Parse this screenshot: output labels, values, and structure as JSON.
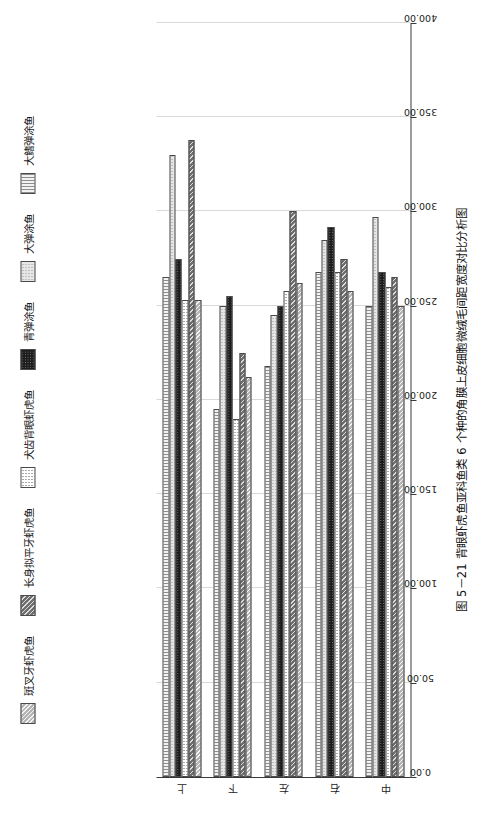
{
  "caption": "图 5－21  背眼虾虎鱼亚科鱼类 6 个种的角膜上皮细胞微绒毛间距宽度对比分析图",
  "legend": {
    "items": [
      {
        "label": "斑叉牙虾虎鱼",
        "pattern": "diagonal-light-hatch",
        "color": "#b4b4b4"
      },
      {
        "label": "长身拟平牙虾虎鱼",
        "pattern": "diagonal-dark-hatch",
        "color": "#6e6e6e"
      },
      {
        "label": "犬齿背眼虾虎鱼",
        "pattern": "sparse-dots",
        "color": "#ffffff"
      },
      {
        "label": "青弹涂鱼",
        "pattern": "solid-black-dots",
        "color": "#1c1c1c"
      },
      {
        "label": "大弹涂鱼",
        "pattern": "fine-dots-light",
        "color": "#e6e6e6"
      },
      {
        "label": "大鳍弹涂鱼",
        "pattern": "vertical-lines",
        "color": "#f2f2f2"
      }
    ]
  },
  "chart_data": {
    "type": "bar",
    "orientation": "horizontal",
    "title": "图 5－21  背眼虾虎鱼亚科鱼类 6 个种的角膜上皮细胞微绒毛间距宽度对比分析图",
    "xlabel": "",
    "ylabel": "",
    "categories": [
      "上",
      "下",
      "左",
      "右",
      "中"
    ],
    "value_axis": {
      "ticks": [
        "0.00",
        "50.00",
        "100.00",
        "150.00",
        "200.00",
        "250.00",
        "300.00",
        "350.00",
        "400.00"
      ],
      "tick_values": [
        0,
        50,
        100,
        150,
        200,
        250,
        300,
        350,
        400
      ],
      "min": 0,
      "max": 400,
      "direction": "right-to-left",
      "grid": true
    },
    "legend_position": "top",
    "series": [
      {
        "name": "斑叉牙虾虎鱼",
        "values": [
          253,
          212,
          262,
          258,
          250
        ]
      },
      {
        "name": "长身拟平牙虾虎鱼",
        "values": [
          338,
          225,
          300,
          275,
          265
        ]
      },
      {
        "name": "犬齿背眼虾虎鱼",
        "values": [
          253,
          190,
          258,
          268,
          260
        ]
      },
      {
        "name": "青弹涂鱼",
        "values": [
          275,
          255,
          250,
          292,
          268
        ]
      },
      {
        "name": "大弹涂鱼",
        "values": [
          330,
          250,
          245,
          285,
          297
        ]
      },
      {
        "name": "大鳍弹涂鱼",
        "values": [
          265,
          195,
          218,
          268,
          250
        ]
      }
    ]
  }
}
